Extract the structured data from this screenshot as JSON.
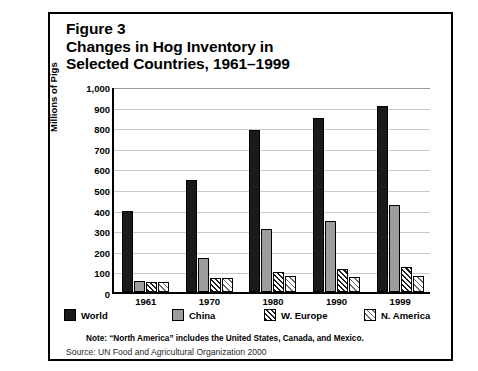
{
  "figure": {
    "title_lines": [
      "Figure 3",
      "Changes in Hog Inventory in",
      "Selected Countries, 1961–1999"
    ],
    "note": "Note: “North America” includes the United States, Canada, and Mexico.",
    "source": "Source: UN Food and Agricultural Organization 2000"
  },
  "colors": {
    "world": "#1a1a1a",
    "china": "#9d9d9d",
    "w_europe": "#1f1f1f",
    "n_america": "#6a6a6a",
    "gridline": "#c9c9c9",
    "axis": "#000000",
    "background": "#ffffff"
  },
  "chart_data": {
    "type": "bar",
    "xlabel": "",
    "ylabel": "Millions of Pigs",
    "ylim": [
      0,
      1000
    ],
    "yticks": [
      0,
      100,
      200,
      300,
      400,
      500,
      600,
      700,
      800,
      900,
      1000
    ],
    "ytick_labels": [
      "0",
      "100",
      "200",
      "300",
      "400",
      "500",
      "600",
      "700",
      "800",
      "900",
      "1,000"
    ],
    "grid": true,
    "legend_position": "below-axes",
    "categories": [
      "1961",
      "1970",
      "1980",
      "1990",
      "1999"
    ],
    "series": [
      {
        "name": "World",
        "pattern": "solid-black",
        "values": [
          395,
          545,
          785,
          845,
          905
        ]
      },
      {
        "name": "China",
        "pattern": "solid-gray",
        "values": [
          55,
          165,
          305,
          345,
          420
        ]
      },
      {
        "name": "W. Europe",
        "pattern": "dense-diagonal-hatch",
        "values": [
          50,
          70,
          95,
          110,
          120
        ]
      },
      {
        "name": "N. America",
        "pattern": "light-diagonal-hatch",
        "values": [
          50,
          68,
          78,
          75,
          80
        ]
      }
    ]
  }
}
